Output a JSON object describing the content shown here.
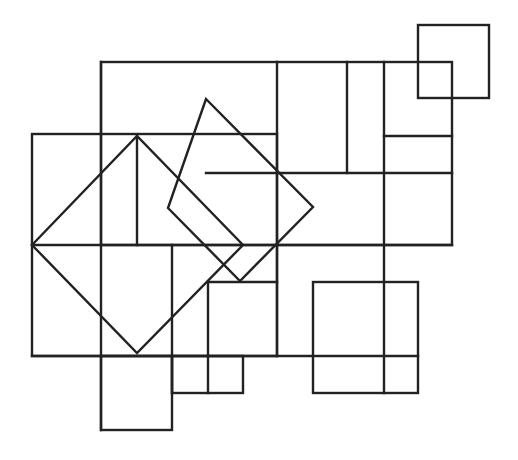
{
  "figure": {
    "stroke_color": "#222222",
    "stroke_width": 2.4,
    "background": "#ffffff",
    "rects": [
      {
        "name": "top-right-small-square",
        "x": 418,
        "y": 25,
        "w": 71,
        "h": 73
      },
      {
        "name": "big-frame-top",
        "x": 101,
        "y": 62,
        "w": 351,
        "h": 183
      },
      {
        "name": "left-square",
        "x": 32,
        "y": 134,
        "w": 245,
        "h": 222
      },
      {
        "name": "bottom-left-square",
        "x": 101,
        "y": 356,
        "w": 71,
        "h": 74
      },
      {
        "name": "bottom-small-rect",
        "x": 172,
        "y": 356,
        "w": 71,
        "h": 37
      },
      {
        "name": "bottom-right-square",
        "x": 313,
        "y": 282,
        "w": 105,
        "h": 111
      }
    ],
    "lines": [
      {
        "name": "v-101",
        "x1": 101,
        "y1": 62,
        "x2": 101,
        "y2": 430
      },
      {
        "name": "v-137",
        "x1": 137,
        "y1": 136,
        "x2": 137,
        "y2": 245
      },
      {
        "name": "v-172",
        "x1": 172,
        "y1": 245,
        "x2": 172,
        "y2": 393
      },
      {
        "name": "v-208",
        "x1": 208,
        "y1": 282,
        "x2": 208,
        "y2": 393
      },
      {
        "name": "v-277",
        "x1": 277,
        "y1": 62,
        "x2": 277,
        "y2": 356
      },
      {
        "name": "v-347",
        "x1": 347,
        "y1": 62,
        "x2": 347,
        "y2": 173
      },
      {
        "name": "v-384",
        "x1": 384,
        "y1": 62,
        "x2": 384,
        "y2": 393
      },
      {
        "name": "h-136",
        "x1": 384,
        "y1": 136,
        "x2": 452,
        "y2": 136
      },
      {
        "name": "h-173",
        "x1": 206,
        "y1": 173,
        "x2": 452,
        "y2": 173
      },
      {
        "name": "h-245",
        "x1": 32,
        "y1": 245,
        "x2": 452,
        "y2": 245
      },
      {
        "name": "h-282",
        "x1": 208,
        "y1": 282,
        "x2": 277,
        "y2": 282
      },
      {
        "name": "h-356",
        "x1": 32,
        "y1": 356,
        "x2": 418,
        "y2": 356
      }
    ],
    "diamonds": [
      {
        "name": "large-diamond",
        "points": "32,245 137,136 243,245 137,353"
      },
      {
        "name": "tilted-square",
        "points": "206,99 313,207 240,281 168,208"
      }
    ]
  }
}
